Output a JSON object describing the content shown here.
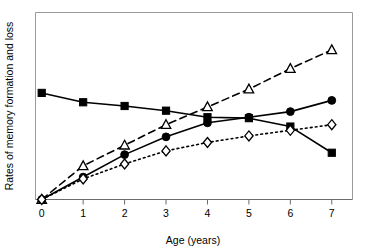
{
  "chart_data": {
    "type": "line",
    "title": "",
    "xlabel": "Age (years)",
    "ylabel": "Rates of memory formation and loss",
    "x": [
      0,
      1,
      2,
      3,
      4,
      5,
      6,
      7
    ],
    "xticklabels": [
      "0",
      "1",
      "2",
      "3",
      "4",
      "5",
      "6",
      "7"
    ],
    "xlim": [
      -0.15,
      7.5
    ],
    "ylim": [
      0,
      100
    ],
    "yticklabels": [],
    "grid": false,
    "legend": "none",
    "series": [
      {
        "name": "memory loss (filled square)",
        "marker": "filled-square",
        "linestyle": "solid",
        "values": [
          57.0,
          52.0,
          50.0,
          47.5,
          44.0,
          43.5,
          39.0,
          25.0
        ]
      },
      {
        "name": "rate A (open triangle)",
        "marker": "open-triangle",
        "linestyle": "dashed",
        "values": [
          0.0,
          18.0,
          29.0,
          40.0,
          49.5,
          59.0,
          70.0,
          80.0
        ]
      },
      {
        "name": "rate B (filled circle)",
        "marker": "filled-circle",
        "linestyle": "solid",
        "values": [
          0.0,
          12.0,
          24.0,
          33.5,
          41.0,
          44.0,
          47.0,
          53.0
        ]
      },
      {
        "name": "rate C (open diamond)",
        "marker": "open-diamond",
        "linestyle": "dotted",
        "values": [
          0.0,
          11.0,
          19.0,
          26.0,
          30.5,
          34.0,
          37.0,
          40.0
        ]
      }
    ]
  }
}
